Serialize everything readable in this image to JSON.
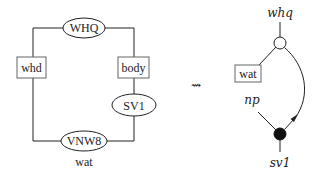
{
  "left_diagram": {
    "ellipses": [
      {
        "label": "WHQ",
        "cx": 84,
        "cy": 28,
        "rx": 21,
        "ry": 10
      },
      {
        "label": "SV1",
        "cx": 134,
        "cy": 105,
        "rx": 22,
        "ry": 11
      },
      {
        "label": "VNW8",
        "cx": 84,
        "cy": 141,
        "rx": 23,
        "ry": 10
      }
    ],
    "boxes": [
      {
        "label": "whd",
        "x": 17,
        "y": 57,
        "w": 29,
        "h": 21
      },
      {
        "label": "body",
        "x": 118,
        "y": 57,
        "w": 31,
        "h": 21
      }
    ],
    "caption": "wat"
  },
  "transform_symbol": "⇝",
  "right_diagram": {
    "top_label": "whq",
    "box_label": "wat",
    "left_label": "np",
    "bottom_label": "sv1",
    "open_node": {
      "cx": 280,
      "cy": 43,
      "r": 6
    },
    "filled_node": {
      "cx": 280,
      "cy": 134,
      "r": 6
    }
  }
}
